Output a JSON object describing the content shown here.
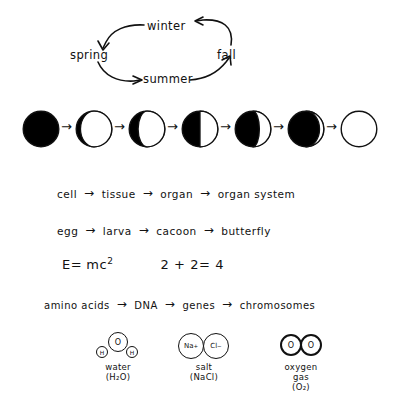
{
  "seasons_cycle": {
    "name": "seasons-cycle",
    "labels": {
      "winter": "winter",
      "spring": "spring",
      "summer": "summer",
      "fall": "fall"
    },
    "arrows": [
      {
        "from": "fall",
        "to": "winter",
        "direction": "left"
      },
      {
        "from": "winter",
        "to": "spring",
        "direction": "down-left"
      },
      {
        "from": "spring",
        "to": "summer",
        "direction": "down-right"
      },
      {
        "from": "summer",
        "to": "fall",
        "direction": "up-right"
      }
    ]
  },
  "moon_phases": {
    "name": "moon-phases",
    "sequence": [
      {
        "label": "new-moon",
        "lit_fraction": 0.0,
        "lit_side": "right"
      },
      {
        "label": "waxing-crescent-thin",
        "lit_fraction": 0.12,
        "lit_side": "right"
      },
      {
        "label": "waxing-crescent",
        "lit_fraction": 0.25,
        "lit_side": "right"
      },
      {
        "label": "first-quarter",
        "lit_fraction": 0.5,
        "lit_side": "right"
      },
      {
        "label": "waxing-gibbous",
        "lit_fraction": 0.68,
        "lit_side": "right"
      },
      {
        "label": "waxing-gibbous-large",
        "lit_fraction": 0.88,
        "lit_side": "right"
      },
      {
        "label": "full-moon",
        "lit_fraction": 1.0,
        "lit_side": "right"
      }
    ],
    "arrow_glyph": "→"
  },
  "chains": {
    "arrow_glyph": "→",
    "biology_levels": {
      "name": "chain-cell-to-organ-system",
      "terms": [
        "cell",
        "tissue",
        "organ",
        "organ system"
      ]
    },
    "metamorphosis": {
      "name": "chain-egg-to-butterfly",
      "terms": [
        "egg",
        "larva",
        "cacoon",
        "butterfly"
      ]
    },
    "genetics": {
      "name": "chain-amino-acids-to-chromosomes",
      "terms": [
        "amino acids",
        "DNA",
        "genes",
        "chromosomes"
      ]
    }
  },
  "equations": {
    "name": "equations-row",
    "energy": {
      "lhs": "E=",
      "base": "mc",
      "exponent": "2"
    },
    "arithmetic": "2 + 2= 4"
  },
  "molecules": [
    {
      "name": "molecule-water",
      "atoms": [
        {
          "symbol": "O",
          "charge": "",
          "size": "large"
        },
        {
          "symbol": "H",
          "charge": "",
          "size": "small"
        },
        {
          "symbol": "H",
          "charge": "",
          "size": "small"
        }
      ],
      "caption_lines": [
        "water",
        "(H₂O)"
      ]
    },
    {
      "name": "molecule-salt",
      "atoms": [
        {
          "symbol": "Na",
          "charge": "+",
          "size": "medium"
        },
        {
          "symbol": "Cl",
          "charge": "−",
          "size": "medium"
        }
      ],
      "caption_lines": [
        "salt",
        "(NaCl)"
      ]
    },
    {
      "name": "molecule-oxygen",
      "atoms": [
        {
          "symbol": "O",
          "charge": "",
          "size": "medium"
        },
        {
          "symbol": "O",
          "charge": "",
          "size": "medium"
        }
      ],
      "caption_lines": [
        "oxygen",
        "gas",
        "(O₂)"
      ]
    }
  ],
  "colors": {
    "ink": "#111111",
    "paper": "#ffffff"
  }
}
